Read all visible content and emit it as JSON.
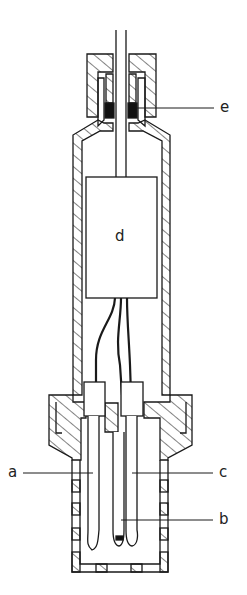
{
  "figure": {
    "type": "cross-section technical drawing of a probe/electrode housing",
    "line_color": "#1a1a1a",
    "fill_black": "#111111",
    "labels": {
      "a": "a",
      "b": "b",
      "c": "c",
      "d": "d",
      "e": "e"
    }
  }
}
